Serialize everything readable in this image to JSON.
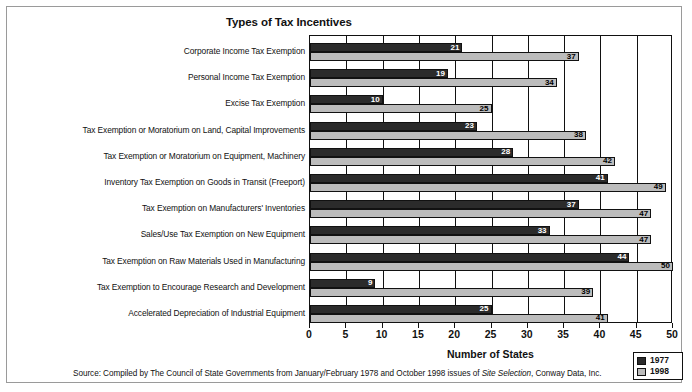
{
  "chart_data": {
    "type": "bar",
    "orientation": "horizontal",
    "title": "Types of Tax Incentives",
    "xlabel": "Number of States",
    "ylabel": "",
    "xlim": [
      0,
      50
    ],
    "xticks": [
      0,
      5,
      10,
      15,
      20,
      25,
      30,
      35,
      40,
      45,
      50
    ],
    "grid": true,
    "legend_position": "bottom-right",
    "categories": [
      "Corporate Income Tax  Exemption",
      "Personal Income Tax Exemption",
      "Excise Tax Exemption",
      "Tax Exemption or Moratorium on Land, Capital Improvements",
      "Tax Exemption or Moratorium on Equipment, Machinery",
      "Inventory Tax Exemption on Goods in Transit (Freeport)",
      "Tax Exemption on Manufacturers' Inventories",
      "Sales/Use Tax Exemption on New Equipment",
      "Tax Exemption on Raw Materials Used in Manufacturing",
      "Tax Exemption to Encourage Research and Development",
      "Accelerated Depreciation of Industrial Equipment"
    ],
    "series": [
      {
        "name": "1977",
        "color": "#2b2b2b",
        "values": [
          21,
          19,
          10,
          23,
          28,
          41,
          37,
          33,
          44,
          9,
          25
        ]
      },
      {
        "name": "1998",
        "color": "#bcbcbc",
        "values": [
          37,
          34,
          25,
          38,
          42,
          49,
          47,
          47,
          50,
          39,
          41
        ]
      }
    ]
  },
  "legend": {
    "items": [
      {
        "label": "1977",
        "swatch": "y1977"
      },
      {
        "label": "1998",
        "swatch": "y1998"
      }
    ]
  },
  "source": {
    "prefix": "Source:  Compiled by The Council of State Governments from January/February 1978 and October 1998 issues of ",
    "italic": "Site Selection",
    "suffix": ", Conway Data, Inc."
  }
}
